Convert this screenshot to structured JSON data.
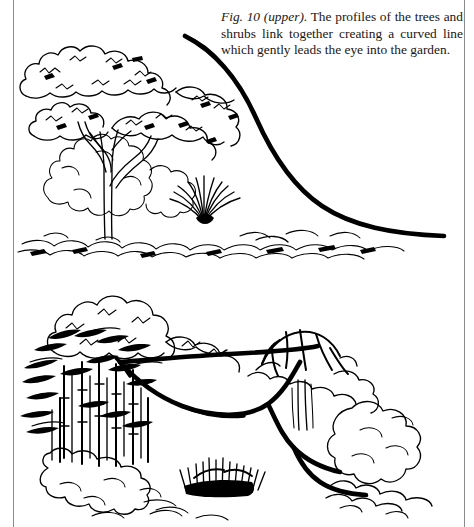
{
  "page": {
    "background_color": "#ffffff",
    "ink_color": "#000000",
    "border_color": "#8b8b8b",
    "width": 474,
    "height": 527
  },
  "caption": {
    "figure_label": "Fig. 10 (upper).",
    "body": " The profiles of the trees and shrubs link together creating a curved line which gently leads the eye into the garden.",
    "full_text": "Fig. 10 (upper). The profiles of the trees and shrubs link together creating a curved line which gently leads the eye into the garden.",
    "lines": [
      "Fig. 10 (upper). The profiles of the",
      "trees and shrubs link together creating",
      "a curved line which gently leads the",
      "eye into the garden."
    ],
    "alignment": "justified"
  },
  "illustrations": [
    {
      "id": "upper",
      "title": "Upper garden profile drawing",
      "description": "Pen and ink garden scene with a spreading layered tree at left, a rounded shrub mass behind it, a fountain shaped grass clump at centre right and low ground cover planting along the base. A single bold curved line sweeps from the upper left over the canopy and descends gently to the right to the ground, linking the plant profiles.",
      "elements": [
        {
          "name": "layered-canopy-tree",
          "label": "Spreading tree with layered canopy"
        },
        {
          "name": "background-shrub-mass",
          "label": "Rounded shrub mass"
        },
        {
          "name": "fountain-grass-clump",
          "label": "Fountain shaped grass clump"
        },
        {
          "name": "ground-cover-planting",
          "label": "Low ground cover planting"
        },
        {
          "name": "profile-curve",
          "label": "Bold curved profile line"
        }
      ]
    },
    {
      "id": "lower",
      "title": "Lower garden profile drawing",
      "description": "Pen and ink garden scene with a dense bamboo thicket at left backed by a billowing tree crown, an umbrella shaped tree at right, shrub masses and a dark grass clump. A bold S shaped curved line runs from the bamboo across the opening and around the right hand tree, leading the eye into the garden.",
      "elements": [
        {
          "name": "bamboo-thicket",
          "label": "Bamboo thicket"
        },
        {
          "name": "billowing-tree-crown",
          "label": "Billowing tree crown"
        },
        {
          "name": "umbrella-tree",
          "label": "Umbrella shaped tree"
        },
        {
          "name": "shrub-mass-right",
          "label": "Right hand shrub mass"
        },
        {
          "name": "dark-grass-clump",
          "label": "Dark grass clump"
        },
        {
          "name": "profile-curve",
          "label": "Bold S shaped profile line"
        }
      ]
    }
  ]
}
